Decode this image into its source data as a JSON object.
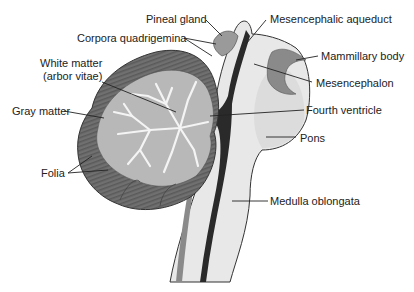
{
  "diagram": {
    "labels": {
      "pineal_gland": "Pineal gland",
      "corpora_quadrigemina": "Corpora quadrigemina",
      "white_matter_1": "White matter",
      "white_matter_2": "(arbor vitae)",
      "gray_matter": "Gray matter",
      "folia": "Folia",
      "mesencephalic_aqueduct": "Mesencephalic aqueduct",
      "mammillary_body": "Mammillary body",
      "mesencephalon": "Mesencephalon",
      "fourth_ventricle": "Fourth ventricle",
      "pons": "Pons",
      "medulla_oblongata": "Medulla oblongata"
    },
    "colors": {
      "folia_dark": "#6e6e6e",
      "gray_matter": "#b4b4b4",
      "white_matter": "#f2f2f2",
      "brainstem": "#e6e6e6",
      "ventricle": "#2a2a2a",
      "leader_line": "#222222"
    }
  }
}
